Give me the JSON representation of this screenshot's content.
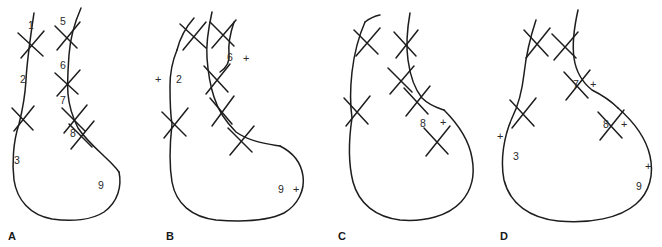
{
  "figure": {
    "background_color": "#ffffff",
    "line_color": "#1d1d1d",
    "text_color": "#2a2a2a",
    "panel_count": 4
  },
  "panels": [
    {
      "letter": "A",
      "letter_x": 8,
      "letter_y": 231,
      "origin_x": 0,
      "width": 150,
      "labels": [
        {
          "text": "1",
          "x": 28,
          "y": 20,
          "kind": "number"
        },
        {
          "text": "5",
          "x": 60,
          "y": 16,
          "kind": "number"
        },
        {
          "text": "2",
          "x": 20,
          "y": 74,
          "kind": "number"
        },
        {
          "text": "6",
          "x": 60,
          "y": 60,
          "kind": "number"
        },
        {
          "text": "7",
          "x": 60,
          "y": 95,
          "kind": "number"
        },
        {
          "text": "8",
          "x": 70,
          "y": 128,
          "kind": "number"
        },
        {
          "text": "3",
          "x": 14,
          "y": 155,
          "kind": "number"
        },
        {
          "text": "9",
          "x": 98,
          "y": 180,
          "kind": "number"
        }
      ]
    },
    {
      "letter": "B",
      "letter_x": 166,
      "letter_y": 231,
      "origin_x": 158,
      "width": 150,
      "labels": [
        {
          "text": "+",
          "x": 155,
          "y": 74,
          "kind": "plus"
        },
        {
          "text": "2",
          "x": 176,
          "y": 74,
          "kind": "number"
        },
        {
          "text": "6",
          "x": 227,
          "y": 52,
          "kind": "number"
        },
        {
          "text": "+",
          "x": 243,
          "y": 53,
          "kind": "plus"
        },
        {
          "text": "9",
          "x": 278,
          "y": 184,
          "kind": "number"
        },
        {
          "text": "+",
          "x": 293,
          "y": 184,
          "kind": "plus"
        }
      ]
    },
    {
      "letter": "C",
      "letter_x": 338,
      "letter_y": 231,
      "origin_x": 330,
      "width": 150,
      "labels": [
        {
          "text": "8",
          "x": 420,
          "y": 118,
          "kind": "number"
        },
        {
          "text": "+",
          "x": 440,
          "y": 117,
          "kind": "plus"
        }
      ]
    },
    {
      "letter": "D",
      "letter_x": 500,
      "letter_y": 231,
      "origin_x": 490,
      "width": 172,
      "labels": [
        {
          "text": "7",
          "x": 573,
          "y": 79,
          "kind": "number"
        },
        {
          "text": "+",
          "x": 590,
          "y": 79,
          "kind": "plus"
        },
        {
          "text": "8",
          "x": 603,
          "y": 119,
          "kind": "number"
        },
        {
          "text": "+",
          "x": 621,
          "y": 119,
          "kind": "plus"
        },
        {
          "text": "+",
          "x": 497,
          "y": 131,
          "kind": "plus"
        },
        {
          "text": "3",
          "x": 513,
          "y": 151,
          "kind": "number"
        },
        {
          "text": "+",
          "x": 645,
          "y": 161,
          "kind": "plus"
        },
        {
          "text": "9",
          "x": 636,
          "y": 181,
          "kind": "number"
        }
      ]
    }
  ]
}
